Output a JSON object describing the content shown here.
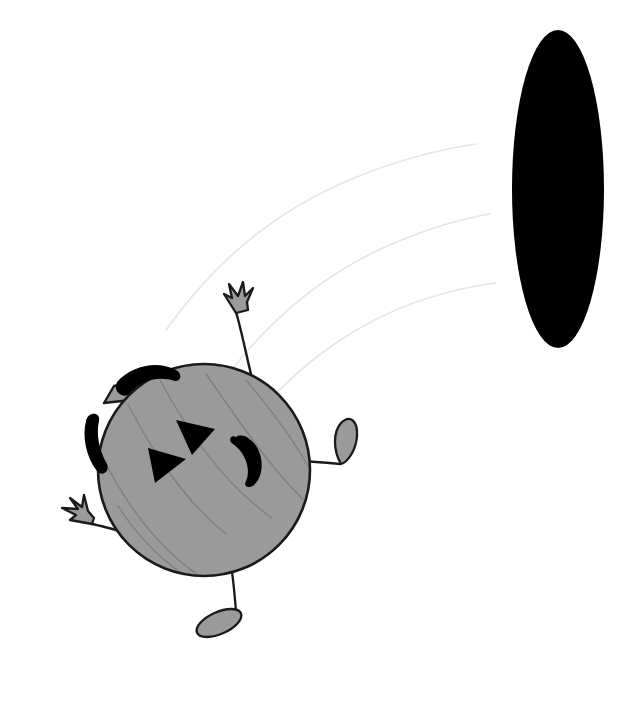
{
  "scene": {
    "title": "Cartoon pumpkin character kicking a ball",
    "width": 642,
    "height": 717,
    "background_color": "#ffffff",
    "description": "A round gray pumpkin-like cartoon creature with a triangular-eyed jack-o-lantern face, thin stick arms and legs, in the lower left; a large solid black vertical ellipse in the upper right; three faint curved motion-trail arcs arc from the creature up toward the black ellipse."
  },
  "palette": {
    "body_fill": "#9a9a9a",
    "outline": "#1a1a1a",
    "face_features": "#000000",
    "ball_fill": "#000000",
    "ridge_line": "#7d7d7d",
    "motion_trail": "#e3e3e3",
    "limb_fill": "#9a9a9a",
    "background": "#ffffff"
  },
  "objects": {
    "ball": {
      "name": "black-ellipse-ball",
      "shape": "ellipse",
      "center_x": 558,
      "center_y": 189,
      "radius_x": 46,
      "radius_y": 159,
      "fill": "#000000"
    },
    "body": {
      "name": "pumpkin-body",
      "shape": "circle",
      "center_x": 204,
      "center_y": 470,
      "radius": 106,
      "fill": "#9a9a9a",
      "stroke": "#1a1a1a",
      "stroke_width": 2.6,
      "ridge_count": 6
    },
    "face": {
      "left_eye": {
        "name": "left-eye-triangle",
        "shape": "triangle",
        "points": "152,449 186,459 156,481",
        "fill": "#000000"
      },
      "right_eye": {
        "name": "right-eye-triangle",
        "shape": "triangle",
        "points": "178,421 213,428 191,452",
        "fill": "#000000"
      },
      "mouth": {
        "name": "mouth-crescent",
        "shape": "crescent",
        "fill": "#000000"
      }
    },
    "stem_tab": {
      "name": "stem-tab",
      "shape": "quadrilateral",
      "fill": "#9a9a9a",
      "stroke": "#1a1a1a"
    },
    "brow_strokes": [
      {
        "name": "top-brow-stroke",
        "fill": "#000000"
      },
      {
        "name": "side-brow-stroke",
        "fill": "#000000"
      }
    ],
    "limbs": [
      {
        "name": "upper-arm-with-hand",
        "type": "arm",
        "end_effector": "three-pronged-hand",
        "direction": "up",
        "stroke": "#1a1a1a"
      },
      {
        "name": "left-arm-with-hand",
        "type": "arm",
        "end_effector": "three-pronged-hand",
        "direction": "left",
        "stroke": "#1a1a1a"
      },
      {
        "name": "right-leg-with-foot",
        "type": "leg",
        "end_effector": "teardrop-foot",
        "direction": "right",
        "stroke": "#1a1a1a"
      },
      {
        "name": "bottom-leg-with-foot",
        "type": "leg",
        "end_effector": "oval-foot",
        "direction": "down",
        "stroke": "#1a1a1a"
      }
    ],
    "motion_trails": [
      {
        "name": "motion-trail-arc-1",
        "path": "M 166 330 C 240 240 340 172 472 146"
      },
      {
        "name": "motion-trail-arc-2",
        "path": "M 232 370 C 300 300 382 246 486 222"
      },
      {
        "name": "motion-trail-arc-3",
        "path": "M 268 400 C 330 352 404 310 492 292"
      }
    ]
  }
}
